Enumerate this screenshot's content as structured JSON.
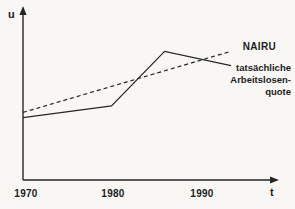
{
  "figure": {
    "background": "#f8f7f4",
    "ink": "#262626"
  },
  "axes": {
    "y_label": "u",
    "x_label": "t",
    "x_ticks": [
      "1970",
      "1980",
      "1990"
    ]
  },
  "labels": {
    "nairu": "NAIRU",
    "actual_line1": "tatsächliche",
    "actual_line2": "Arbeitslosen-",
    "actual_line3": "quote"
  },
  "chart_data": {
    "type": "line",
    "title": "",
    "xlabel": "t",
    "ylabel": "u",
    "x_tick_years": [
      1970,
      1980,
      1990
    ],
    "xlim": [
      1970,
      1995.5
    ],
    "ylim": [
      0,
      12
    ],
    "grid": false,
    "legend_position": "inline-right",
    "y_units": "arbitrary (no numeric scale shown)",
    "series": [
      {
        "key": "nairu",
        "name": "NAIRU",
        "style": "dashed",
        "points": [
          [
            1970,
            5.2
          ],
          [
            1993.5,
            9.9
          ]
        ]
      },
      {
        "key": "actual-unemployment",
        "name": "tatsächliche Arbeitslosenquote",
        "style": "solid",
        "points": [
          [
            1970,
            4.8
          ],
          [
            1980,
            5.7
          ],
          [
            1986,
            9.9
          ],
          [
            1993.5,
            8.8
          ]
        ]
      }
    ]
  }
}
